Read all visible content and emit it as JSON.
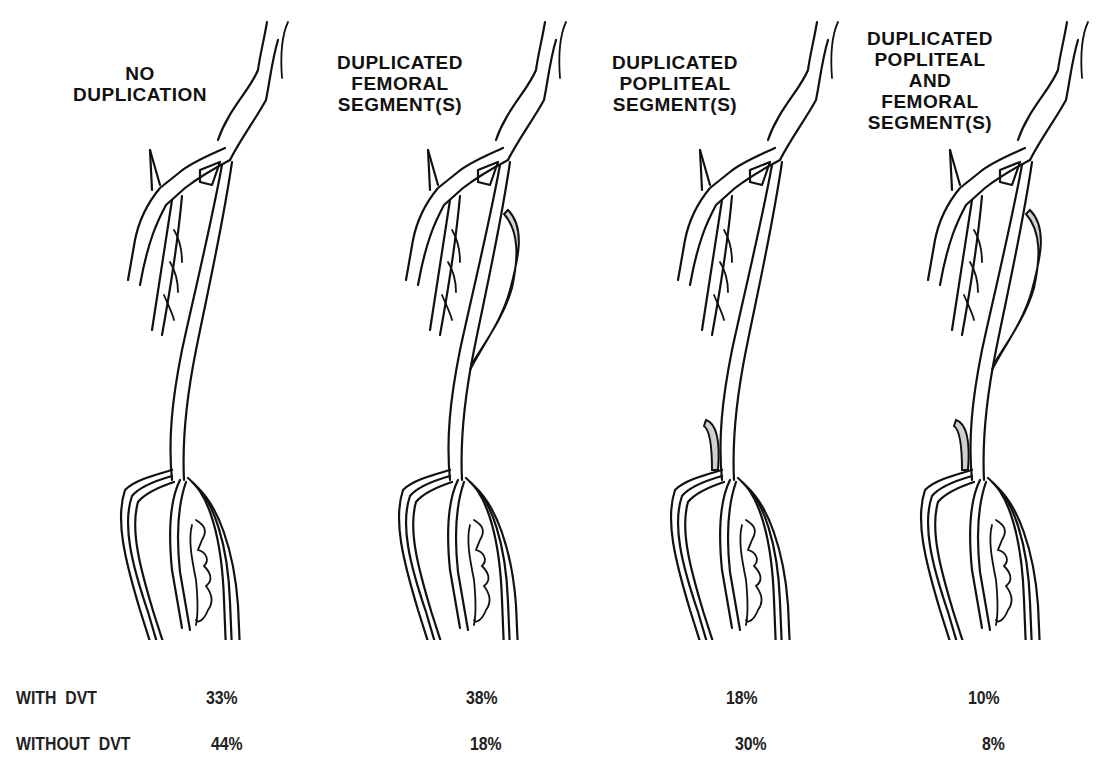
{
  "figure": {
    "panels": [
      {
        "id": "no-duplication",
        "title_lines": [
          "NO",
          "DUPLICATION"
        ],
        "duplicated_femoral": false,
        "duplicated_popliteal": false
      },
      {
        "id": "duplicated-femoral",
        "title_lines": [
          "DUPLICATED",
          "FEMORAL",
          "SEGMENT(S)"
        ],
        "duplicated_femoral": true,
        "duplicated_popliteal": false
      },
      {
        "id": "duplicated-popliteal",
        "title_lines": [
          "DUPLICATED",
          "POPLITEAL",
          "SEGMENT(S)"
        ],
        "duplicated_femoral": false,
        "duplicated_popliteal": true
      },
      {
        "id": "duplicated-popliteal-and-femoral",
        "title_lines": [
          "DUPLICATED",
          "POPLITEAL",
          "AND",
          "FEMORAL",
          "SEGMENT(S)"
        ],
        "duplicated_femoral": true,
        "duplicated_popliteal": true
      }
    ],
    "shading_color": "#d0d0d0",
    "line_color": "#111111"
  },
  "table": {
    "rows": [
      {
        "label": "WITH  DVT",
        "values": [
          "33%",
          "38%",
          "18%",
          "10%"
        ]
      },
      {
        "label": "WITHOUT  DVT",
        "values": [
          "44%",
          "18%",
          "30%",
          "8%"
        ]
      }
    ]
  }
}
